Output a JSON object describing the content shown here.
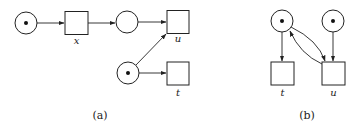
{
  "figure": {
    "subfigures": [
      {
        "caption": "(a)",
        "places": [
          {
            "id": "p1",
            "tokens": 1
          },
          {
            "id": "p2",
            "tokens": 0
          },
          {
            "id": "p3",
            "tokens": 1
          }
        ],
        "transitions": [
          {
            "id": "x",
            "label": "x"
          },
          {
            "id": "u",
            "label": "u"
          },
          {
            "id": "t",
            "label": "t"
          }
        ],
        "arcs": [
          {
            "from": "p1",
            "to": "x"
          },
          {
            "from": "x",
            "to": "p2"
          },
          {
            "from": "p2",
            "to": "u"
          },
          {
            "from": "p3",
            "to": "u"
          },
          {
            "from": "p3",
            "to": "t"
          }
        ]
      },
      {
        "caption": "(b)",
        "places": [
          {
            "id": "q1",
            "tokens": 1
          },
          {
            "id": "q2",
            "tokens": 1
          }
        ],
        "transitions": [
          {
            "id": "t",
            "label": "t"
          },
          {
            "id": "u",
            "label": "u"
          }
        ],
        "arcs": [
          {
            "from": "q1",
            "to": "t"
          },
          {
            "from": "q1",
            "to": "u"
          },
          {
            "from": "u",
            "to": "q1"
          },
          {
            "from": "q2",
            "to": "u"
          }
        ]
      }
    ]
  }
}
